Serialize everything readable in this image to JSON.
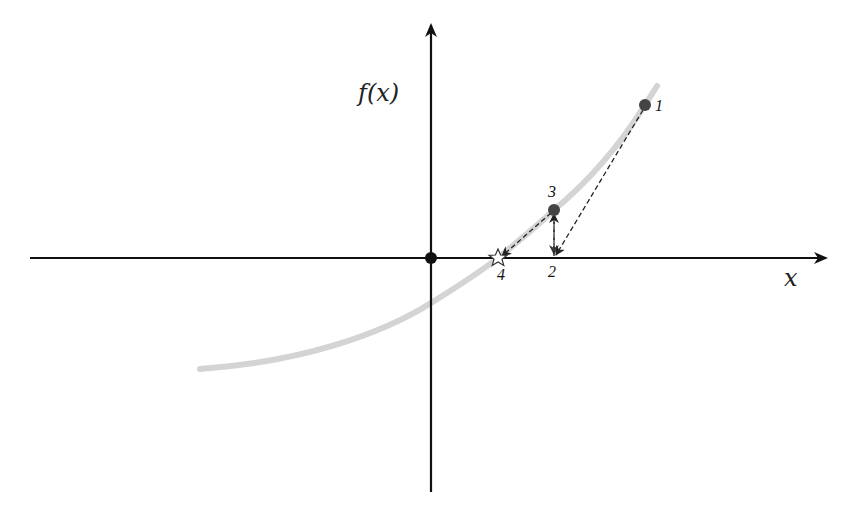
{
  "diagram": {
    "type": "newton-secant-iteration",
    "axes": {
      "x_label": "x",
      "y_label": "f(x)",
      "color": "#111111"
    },
    "curve": {
      "color": "#d4d4d4",
      "description": "increasing convex function crossing x-axis right of origin"
    },
    "points": [
      {
        "id": "1",
        "label": "1",
        "marker": "dot",
        "on": "curve"
      },
      {
        "id": "2",
        "label": "2",
        "marker": "none",
        "on": "x-axis"
      },
      {
        "id": "3",
        "label": "3",
        "marker": "dot",
        "on": "curve"
      },
      {
        "id": "4",
        "label": "4",
        "marker": "star",
        "on": "x-axis (root)"
      }
    ],
    "origin_marker": "dot",
    "steps": [
      {
        "from": "1",
        "to": "2",
        "style": "dashed-arrow"
      },
      {
        "from": "2",
        "to": "3",
        "style": "dashed-arrow"
      },
      {
        "from": "3",
        "to": "4",
        "style": "dashed-arrow"
      }
    ],
    "colors": {
      "dot": "#444444",
      "dashed": "#222222",
      "star_fill": "#ffffff",
      "star_stroke": "#333333"
    }
  }
}
